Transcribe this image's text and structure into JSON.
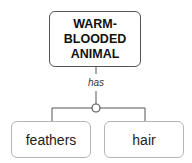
{
  "diagram": {
    "type": "concept-map",
    "root": {
      "label": "WARM-\nBLOODED\nANIMAL",
      "lines": [
        "WARM-",
        "BLOODED",
        "ANIMAL"
      ]
    },
    "relation": {
      "label": "has"
    },
    "children": [
      {
        "label": "feathers"
      },
      {
        "label": "hair"
      }
    ],
    "colors": {
      "root_border": "#555555",
      "child_border": "#b5b5b5",
      "connector": "#555555"
    }
  }
}
